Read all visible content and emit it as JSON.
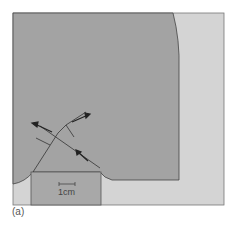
{
  "figure": {
    "caption": "(a)",
    "scale_bar_label": "1cm",
    "colors": {
      "background_light": "#d4d4d4",
      "workpiece_dark": "#a3a3a3",
      "tool_block": "#a8a8a8",
      "outline": "#444444",
      "arrow": "#222222"
    },
    "elements": [
      "workpiece",
      "tool-block",
      "shear-plane-lines",
      "flow-arrows",
      "scale-bar"
    ]
  }
}
